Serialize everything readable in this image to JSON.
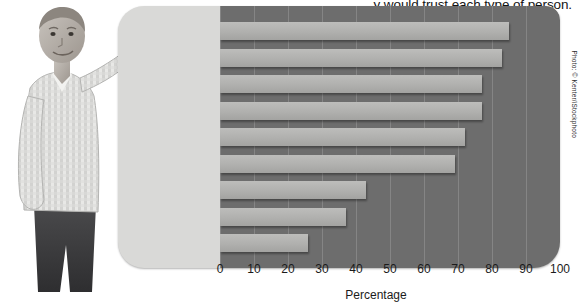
{
  "caption": "y would trust each type of person.",
  "photo": {
    "alt_name": "presenter-photo",
    "credit": "Photo: © Kenter/iStockphoto"
  },
  "colors": {
    "panel_bg": "#d9d9d7",
    "plot_bg": "#6d6d6d",
    "bar": "#b0b0ae",
    "gridline": "#8a8a8a",
    "text": "#1b1b1b"
  },
  "chart_data": {
    "type": "bar",
    "orientation": "horizontal",
    "title": "",
    "xlabel": "Percentage",
    "ylabel": "",
    "xlim": [
      0,
      100
    ],
    "xticks": [
      0,
      10,
      20,
      30,
      40,
      50,
      60,
      70,
      80,
      90,
      100
    ],
    "grid": true,
    "legend": "none",
    "categories": [
      "Doctors",
      "Teachers",
      "Scientists",
      "Police officers",
      "Military officers",
      "Judges",
      "TV newscasters",
      "Journalists",
      "Lawyers"
    ],
    "values": [
      85,
      83,
      77,
      77,
      72,
      69,
      43,
      37,
      26
    ]
  }
}
